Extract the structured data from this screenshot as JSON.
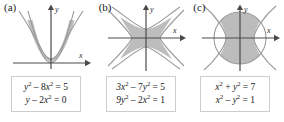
{
  "figure": {
    "panel_count": 3,
    "background_color": "#ffffff",
    "shade_color": "#b9b9b9",
    "curve_color": "#9a9a9a",
    "axis_color": "#4a4a4a",
    "box_border_color": "#cdcdcd"
  },
  "panels": [
    {
      "label": "(a)",
      "axes": {
        "x_label": "x",
        "y_label": "y"
      },
      "equations": [
        {
          "lhs": "y² − 8x²",
          "rhs": "5",
          "full": "y2 - 8x2 = 5"
        },
        {
          "lhs": "y − 2x²",
          "rhs": "0",
          "full": "y - 2x2 = 0"
        }
      ],
      "eq_display": [
        {
          "var1": "y",
          "exp1": "2",
          "op": "–",
          "coef": "8",
          "var2": "x",
          "exp2": "2",
          "eq": "=",
          "value": "5"
        },
        {
          "var1": "y",
          "exp1": "",
          "op": "–",
          "coef": "2",
          "var2": "x",
          "exp2": "2",
          "eq": "=",
          "value": "0"
        }
      ],
      "curves": [
        "hyperbola-vertical",
        "parabola-upward"
      ],
      "region": "narrow-region-between-parabola-and-hyperbola"
    },
    {
      "label": "(b)",
      "axes": {
        "x_label": "x",
        "y_label": "y"
      },
      "equations": [
        {
          "lhs": "3x² − 7y²",
          "rhs": "5",
          "full": "3x2 - 7y2 = 5"
        },
        {
          "lhs": "9y² − 2x²",
          "rhs": "1",
          "full": "9y2 - 2x2 = 1"
        }
      ],
      "eq_display": [
        {
          "var1": "3x",
          "exp1": "2",
          "op": "–",
          "coef": "7",
          "var2": "y",
          "exp2": "2",
          "eq": "=",
          "value": "5"
        },
        {
          "var1": "9y",
          "exp1": "2",
          "op": "–",
          "coef": "2",
          "var2": "x",
          "exp2": "2",
          "eq": "=",
          "value": "1"
        }
      ],
      "curves": [
        "hyperbola-horizontal",
        "hyperbola-vertical"
      ],
      "region": "four-pointed-star-region"
    },
    {
      "label": "(c)",
      "axes": {
        "x_label": "x",
        "y_label": "y"
      },
      "equations": [
        {
          "lhs": "x² + y²",
          "rhs": "7",
          "full": "x2 + y2 = 7"
        },
        {
          "lhs": "x² − y²",
          "rhs": "1",
          "full": "x2 - y2 = 1"
        }
      ],
      "eq_display": [
        {
          "var1": "x",
          "exp1": "2",
          "op": "+",
          "coef": "",
          "var2": "y",
          "exp2": "2",
          "eq": "=",
          "value": "7"
        },
        {
          "var1": "x",
          "exp1": "2",
          "op": "–",
          "coef": "",
          "var2": "y",
          "exp2": "2",
          "eq": "=",
          "value": "1"
        }
      ],
      "curves": [
        "circle",
        "hyperbola-horizontal"
      ],
      "region": "circle-minus-hyperbola-interiors"
    }
  ]
}
